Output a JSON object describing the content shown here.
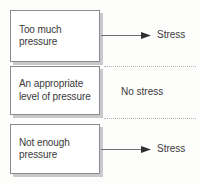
{
  "diagram": {
    "colors": {
      "page_background": "#fdfdfc",
      "box_background": "#ffffff",
      "box_border": "#8a8a8f",
      "box_shadow": "#c9c9cd",
      "text": "#3a3a3a",
      "arrow_line": "#6e6e73",
      "arrow_head": "#2f2f33",
      "dotted_separator": "#b6b6bb"
    },
    "rows": [
      {
        "id": "too-much-pressure",
        "box_lines": [
          "Too much",
          "pressure"
        ],
        "connector": "arrow",
        "outcome": "Stress"
      },
      {
        "id": "appropriate-pressure",
        "box_lines": [
          "An appropriate",
          "level of pressure"
        ],
        "connector": "none",
        "outcome": "No stress"
      },
      {
        "id": "not-enough-pressure",
        "box_lines": [
          "Not enough",
          "pressure"
        ],
        "connector": "arrow",
        "outcome": "Stress"
      }
    ]
  }
}
